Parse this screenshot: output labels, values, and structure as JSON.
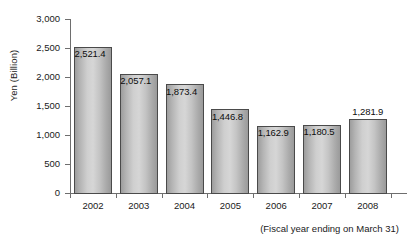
{
  "chart_data": {
    "type": "bar",
    "title": "",
    "subtitle": "",
    "xlabel": "",
    "ylabel": "Yen (Billion)",
    "categories": [
      "2002",
      "2003",
      "2004",
      "2005",
      "2006",
      "2007",
      "2008"
    ],
    "values": [
      2521.4,
      2057.1,
      1873.4,
      1446.8,
      1162.9,
      1180.5,
      1281.9
    ],
    "value_labels": [
      "2,521.4",
      "2,057.1",
      "1,873.4",
      "1,446.8",
      "1,162.9",
      "1,180.5",
      "1,281.9"
    ],
    "ylim": [
      0,
      3000
    ],
    "ytick_values": [
      0,
      500,
      1000,
      1500,
      2000,
      2500,
      3000
    ],
    "ytick_labels": [
      "0",
      "500",
      "1,000",
      "1,500",
      "2,000",
      "2,500",
      "3,000"
    ],
    "grid": false,
    "legend": null,
    "annotation": "(Fiscal year ending on March 31)",
    "bar_fill_color": "#c8c8c8",
    "bar_border_color": "#4a4a4a",
    "axis_color": "#6e6e6e",
    "text_color": "#1a1a1a",
    "label_placement": [
      "inside-top",
      "inside-top",
      "inside-top",
      "inside-top",
      "inside-top",
      "inside-top",
      "above"
    ]
  }
}
